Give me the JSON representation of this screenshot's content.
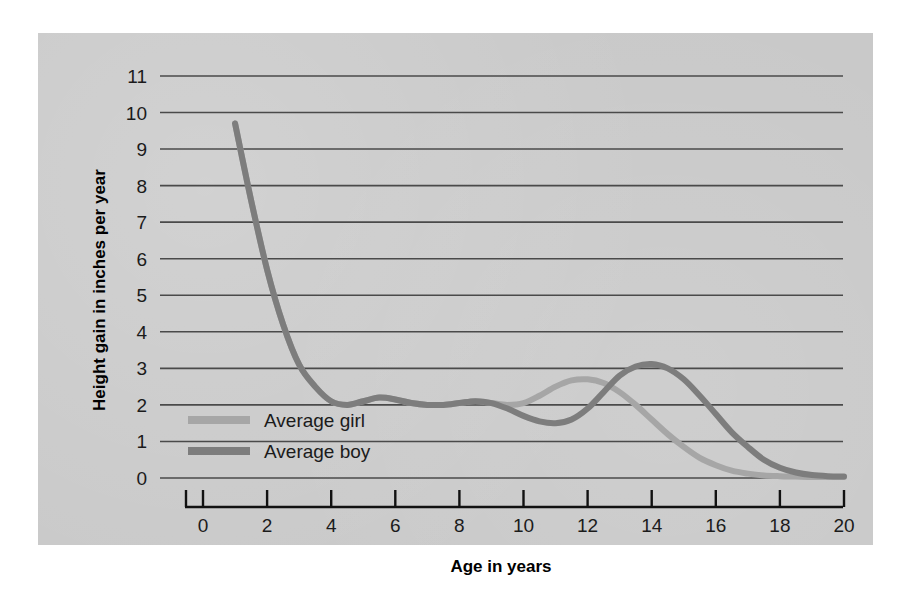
{
  "chart_data": {
    "type": "line",
    "title": "",
    "xlabel": "Age in years",
    "ylabel": "Height gain in inches per year",
    "xlim": [
      0,
      20
    ],
    "ylim": [
      0,
      11
    ],
    "xticks": [
      "0",
      "2",
      "4",
      "6",
      "8",
      "10",
      "12",
      "14",
      "16",
      "18",
      "20"
    ],
    "yticks": [
      "0",
      "1",
      "2",
      "3",
      "4",
      "5",
      "6",
      "7",
      "8",
      "9",
      "10",
      "11"
    ],
    "grid": "horizontal",
    "legend_position": "inside-lower-left",
    "series": [
      {
        "name": "Average girl",
        "color": "#a6a6a6",
        "x": [
          1,
          1.5,
          2,
          2.5,
          3,
          3.5,
          4,
          4.5,
          5,
          5.5,
          6,
          6.5,
          7,
          7.5,
          8,
          8.5,
          9,
          9.5,
          10,
          10.5,
          11,
          11.5,
          12,
          12.5,
          13,
          13.5,
          14,
          14.5,
          15,
          15.5,
          16,
          16.5,
          17,
          17.5,
          18,
          18.5,
          19,
          19.5,
          20
        ],
        "values": [
          9.7,
          7.6,
          5.7,
          4.2,
          3.1,
          2.5,
          2.1,
          2.0,
          2.1,
          2.2,
          2.15,
          2.05,
          2.0,
          2.0,
          2.05,
          2.1,
          2.05,
          2.0,
          2.05,
          2.25,
          2.5,
          2.67,
          2.7,
          2.6,
          2.35,
          2.0,
          1.6,
          1.2,
          0.85,
          0.55,
          0.35,
          0.2,
          0.12,
          0.07,
          0.05,
          0.04,
          0.03,
          0.03,
          0.03
        ]
      },
      {
        "name": "Average boy",
        "color": "#7d7d7d",
        "x": [
          1,
          1.5,
          2,
          2.5,
          3,
          3.5,
          4,
          4.5,
          5,
          5.5,
          6,
          6.5,
          7,
          7.5,
          8,
          8.5,
          9,
          9.5,
          10,
          10.5,
          11,
          11.5,
          12,
          12.5,
          13,
          13.5,
          14,
          14.5,
          15,
          15.5,
          16,
          16.5,
          17,
          17.5,
          18,
          18.5,
          19,
          19.5,
          20
        ],
        "values": [
          9.7,
          7.6,
          5.7,
          4.2,
          3.1,
          2.5,
          2.1,
          2.0,
          2.1,
          2.2,
          2.15,
          2.05,
          2.0,
          2.0,
          2.05,
          2.1,
          2.05,
          1.9,
          1.7,
          1.55,
          1.5,
          1.6,
          1.9,
          2.35,
          2.8,
          3.05,
          3.12,
          3.0,
          2.7,
          2.25,
          1.75,
          1.25,
          0.85,
          0.5,
          0.28,
          0.15,
          0.08,
          0.05,
          0.04
        ]
      }
    ],
    "annotations": {
      "girl_peak": {
        "age": 12,
        "value": 2.7
      },
      "boy_peak": {
        "age": 14.2,
        "value": 3.1
      },
      "boy_trough": {
        "age": 11,
        "value": 1.5
      },
      "start": {
        "age": 1,
        "value": 9.7
      }
    }
  },
  "legend": {
    "items": [
      {
        "label": "Average girl",
        "color": "#a6a6a6"
      },
      {
        "label": "Average boy",
        "color": "#7d7d7d"
      }
    ]
  },
  "colors": {
    "panel_background": "#c9c9c9",
    "page_background": "#ffffff",
    "gridline": "#4a4a4a",
    "axis": "#111111",
    "text": "#1b1b1b"
  }
}
